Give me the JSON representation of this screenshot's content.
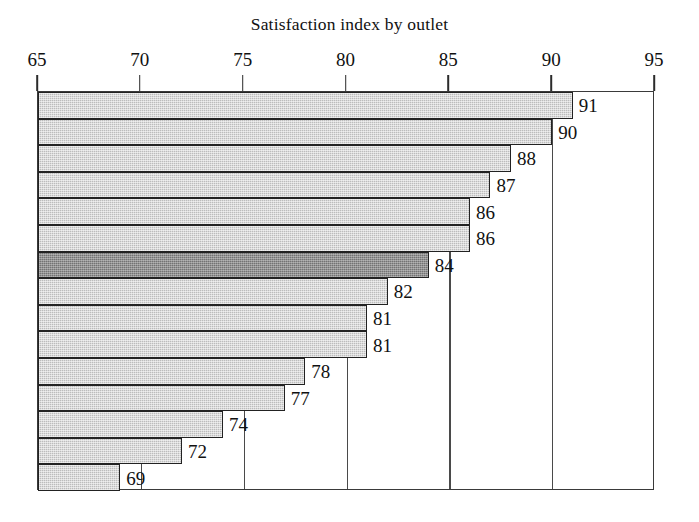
{
  "chart_data": {
    "type": "bar",
    "orientation": "horizontal",
    "title": "Satisfaction index by outlet",
    "xlabel": "",
    "ylabel": "",
    "xlim": [
      65,
      95
    ],
    "xticks": [
      65,
      70,
      75,
      80,
      85,
      90,
      95
    ],
    "xtick_labels": [
      "65",
      "70",
      "75",
      "80",
      "85",
      "90",
      "95"
    ],
    "axis_position": "top",
    "grid": true,
    "grid_axis": "x",
    "legend": null,
    "categories": [
      "",
      "",
      "",
      "",
      "",
      "",
      "",
      "",
      "",
      "",
      "",
      "",
      "",
      "",
      ""
    ],
    "values": [
      91,
      90,
      88,
      87,
      86,
      86,
      84,
      82,
      81,
      81,
      78,
      77,
      74,
      72,
      69
    ],
    "data_labels": [
      "91",
      "90",
      "88",
      "87",
      "86",
      "86",
      "84",
      "82",
      "81",
      "81",
      "78",
      "77",
      "74",
      "72",
      "69"
    ],
    "highlighted_index": 6,
    "bar_color": "#bcbcbc",
    "highlight_color": "#737373",
    "bar_border_color": "#222222",
    "frame_color": "#3a3a3a",
    "text_color": "#111111",
    "background": "#ffffff"
  },
  "geometry": {
    "plot_left": 37,
    "plot_right": 654,
    "plot_top": 91,
    "plot_bottom": 490,
    "tick_label_y": 50,
    "tick_mark_top": 75,
    "tick_mark_height": 16
  }
}
